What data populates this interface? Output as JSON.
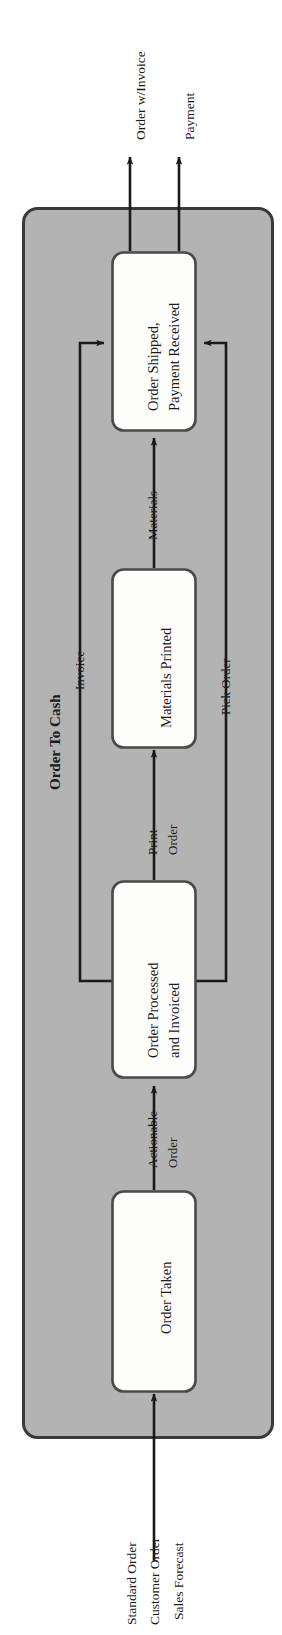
{
  "diagram": {
    "title": "Order To Cash",
    "type": "process-flow",
    "orientation": "rotated-90-ccw",
    "colors": {
      "pool_fill": "#b3b3b3",
      "pool_stroke": "#3a3a3a",
      "node_fill": "#fdfdfb",
      "node_stroke": "#4a4a4a",
      "arrow": "#1a1a1a",
      "text": "#1a1a1a",
      "background": "#ffffff"
    },
    "pool": {
      "label": "Order To Cash"
    },
    "nodes": [
      {
        "id": "order-taken",
        "label": "Order Taken"
      },
      {
        "id": "order-processed-and-invoiced",
        "label": "Order Processed\nand Invoiced",
        "line1": "Order Processed",
        "line2": "and Invoiced"
      },
      {
        "id": "materials-printed",
        "label": "Materials Printed"
      },
      {
        "id": "order-shipped-payment-received",
        "label": "Order Shipped,\nPayment Received",
        "line1": "Order Shipped,",
        "line2": "Payment Received"
      }
    ],
    "inputs": [
      {
        "id": "standard-order",
        "label": "Standard Order"
      },
      {
        "id": "customer-order",
        "label": "Customer Order"
      },
      {
        "id": "sales-forecast",
        "label": "Sales Forecast"
      }
    ],
    "outputs": [
      {
        "id": "order-with-invoice",
        "label": "Order w/Invoice"
      },
      {
        "id": "payment",
        "label": "Payment"
      }
    ],
    "flows": [
      {
        "id": "actionable-order",
        "line1": "Actionable",
        "line2": "Order",
        "from": "order-taken",
        "to": "order-processed-and-invoiced"
      },
      {
        "id": "print-order",
        "line1": "Print",
        "line2": "Order",
        "from": "order-processed-and-invoiced",
        "to": "materials-printed"
      },
      {
        "id": "materials",
        "line1": "Materials",
        "line2": "",
        "from": "materials-printed",
        "to": "order-shipped-payment-received"
      },
      {
        "id": "invoice",
        "line1": "Invoice",
        "line2": "",
        "from": "order-processed-and-invoiced",
        "to": "order-shipped-payment-received"
      },
      {
        "id": "pick-order",
        "line1": "Pick Order",
        "line2": "",
        "from": "order-processed-and-invoiced",
        "to": "order-shipped-payment-received"
      }
    ]
  }
}
